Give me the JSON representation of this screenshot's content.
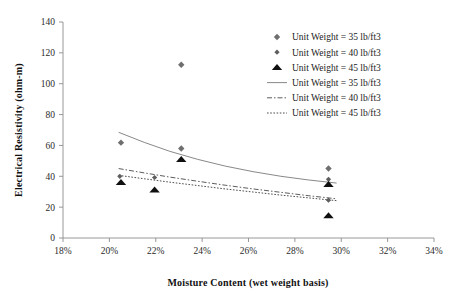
{
  "chart_data": {
    "type": "scatter",
    "title": "",
    "xlabel": "Moisture Content (wet weight basis)",
    "ylabel": "Electrical Resistivity (ohm-m)",
    "xlim": [
      18,
      34
    ],
    "ylim": [
      0,
      140
    ],
    "xticks": [
      "18%",
      "20%",
      "22%",
      "24%",
      "26%",
      "28%",
      "30%",
      "32%",
      "34%"
    ],
    "xtick_values": [
      18,
      20,
      22,
      24,
      26,
      28,
      30,
      32,
      34
    ],
    "yticks": [
      "0",
      "20",
      "40",
      "60",
      "80",
      "100",
      "120",
      "140"
    ],
    "ytick_values": [
      0,
      20,
      40,
      60,
      80,
      100,
      120,
      140
    ],
    "grid": false,
    "legend_position": "top-right",
    "series": [
      {
        "name": "Unit Weight = 35 lb/ft3",
        "kind": "scatter",
        "marker": "diamond",
        "color": "#6f6f6f",
        "points": [
          {
            "x": 20.5,
            "y": 61.8
          },
          {
            "x": 23.1,
            "y": 112.3
          },
          {
            "x": 23.1,
            "y": 58.0
          },
          {
            "x": 29.45,
            "y": 45.0
          }
        ]
      },
      {
        "name": "Unit Weight = 40 lb/ft3",
        "kind": "scatter",
        "marker": "diamond-small",
        "color": "#5e5e5e",
        "points": [
          {
            "x": 20.45,
            "y": 40.0
          },
          {
            "x": 21.95,
            "y": 39.2
          },
          {
            "x": 29.45,
            "y": 38.0
          },
          {
            "x": 29.45,
            "y": 24.5
          }
        ]
      },
      {
        "name": "Unit Weight = 45 lb/ft3",
        "kind": "scatter",
        "marker": "triangle",
        "color": "#101010",
        "points": [
          {
            "x": 20.5,
            "y": 36.0
          },
          {
            "x": 21.95,
            "y": 31.2
          },
          {
            "x": 23.1,
            "y": 51.0
          },
          {
            "x": 29.45,
            "y": 34.8
          },
          {
            "x": 29.45,
            "y": 14.5
          }
        ]
      },
      {
        "name": "Unit Weight = 35 lb/ft3",
        "kind": "line",
        "style": "solid",
        "color": "#7a7a7a",
        "x": [
          20.4,
          21.5,
          22.6,
          23.8,
          25.0,
          26.2,
          27.4,
          28.6,
          29.8
        ],
        "y": [
          68.5,
          62.0,
          56.2,
          51.0,
          46.6,
          43.0,
          40.0,
          37.6,
          35.6
        ]
      },
      {
        "name": "Unit Weight = 40 lb/ft3",
        "kind": "line",
        "style": "dash-dot",
        "color": "#4a4a4a",
        "x": [
          20.4,
          21.5,
          22.6,
          23.8,
          25.0,
          26.2,
          27.4,
          28.6,
          29.8
        ],
        "y": [
          45.0,
          42.2,
          39.5,
          36.8,
          34.2,
          31.8,
          29.6,
          27.4,
          25.4
        ]
      },
      {
        "name": "Unit Weight = 45 lb/ft3",
        "kind": "line",
        "style": "dotted",
        "color": "#3a3a3a",
        "x": [
          20.4,
          21.5,
          22.6,
          23.8,
          25.0,
          26.2,
          27.4,
          28.6,
          29.8
        ],
        "y": [
          40.6,
          38.4,
          36.2,
          34.0,
          31.8,
          29.8,
          27.8,
          26.0,
          24.2
        ]
      }
    ],
    "legend": [
      {
        "label": "Unit Weight = 35 lb/ft3",
        "glyph": "diamond"
      },
      {
        "label": "Unit Weight = 40 lb/ft3",
        "glyph": "diamond-small"
      },
      {
        "label": "Unit Weight = 45 lb/ft3",
        "glyph": "triangle"
      },
      {
        "label": "Unit Weight = 35 lb/ft3",
        "glyph": "line-solid"
      },
      {
        "label": "Unit Weight = 40 lb/ft3",
        "glyph": "line-dash-dot"
      },
      {
        "label": "Unit Weight = 45 lb/ft3",
        "glyph": "line-dotted"
      }
    ]
  }
}
